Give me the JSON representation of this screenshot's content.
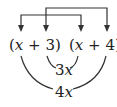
{
  "diagram": {
    "factor_left": {
      "open": "(",
      "var": "x",
      "op": " + ",
      "const": "3",
      "close": ")"
    },
    "factor_right": {
      "open": "(",
      "var": "x",
      "op": " + ",
      "const": "4",
      "close": ")"
    },
    "inner_product_label": {
      "coef": "3",
      "var": "x"
    },
    "outer_product_label": {
      "coef": "4",
      "var": "x"
    },
    "connections": [
      {
        "type": "bracket-arrow",
        "from": "left x",
        "to": "right x",
        "meaning": "first terms"
      },
      {
        "type": "bracket-arrow",
        "from": "left 3",
        "to": "right 4",
        "meaning": "last terms"
      },
      {
        "type": "arc",
        "from": "left 3",
        "to": "right x",
        "label": "3x",
        "meaning": "inner terms"
      },
      {
        "type": "arc",
        "from": "left x",
        "to": "right 4",
        "label": "4x",
        "meaning": "outer terms"
      }
    ],
    "colors": {
      "ink": "#333333",
      "background": "#ffffff"
    }
  }
}
